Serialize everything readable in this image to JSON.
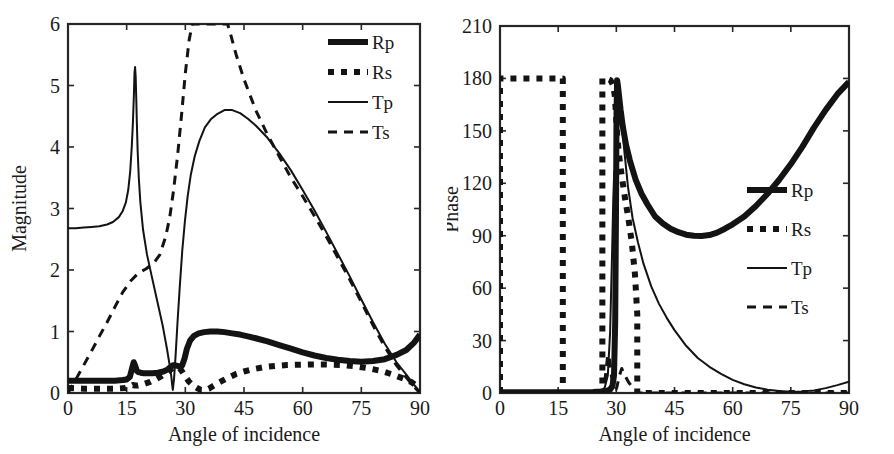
{
  "figure": {
    "background": "#ffffff",
    "ink_color": "#131313",
    "panel_count": 2
  },
  "chart_data": [
    {
      "id": "magnitude-plot",
      "type": "line",
      "title": "",
      "xlabel": "Angle of incidence",
      "ylabel": "Magnitude",
      "xlim": [
        0,
        90
      ],
      "ylim": [
        0,
        6
      ],
      "xticks": [
        0,
        15,
        30,
        45,
        60,
        75,
        90
      ],
      "yticks": [
        0,
        1,
        2,
        3,
        4,
        5,
        6
      ],
      "xticklabels": [
        "0",
        "15",
        "30",
        "45",
        "60",
        "75",
        "90"
      ],
      "yticklabels": [
        "0",
        "1",
        "2",
        "3",
        "4",
        "5",
        "6"
      ],
      "grid": false,
      "legend_position": "top-right",
      "series": [
        {
          "name": "Rp",
          "style": "thick-solid",
          "x": [
            0,
            3,
            6,
            9,
            12,
            14,
            15,
            15.8,
            16.3,
            16.8,
            17.2,
            17.6,
            18,
            18.6,
            19.4,
            20.4,
            21.6,
            23,
            24.4,
            25.4,
            26.2,
            26.8,
            27.4,
            28,
            28.6,
            29.2,
            29.8,
            30.4,
            31.2,
            32.2,
            33.4,
            34.8,
            36.4,
            38.2,
            40,
            42,
            44,
            46,
            48,
            51,
            54,
            57,
            60,
            63,
            66,
            69,
            72,
            75,
            78,
            81,
            84,
            86.5,
            88.5,
            90
          ],
          "y": [
            0.2,
            0.2,
            0.2,
            0.2,
            0.2,
            0.21,
            0.22,
            0.26,
            0.38,
            0.5,
            0.44,
            0.36,
            0.34,
            0.33,
            0.32,
            0.32,
            0.32,
            0.33,
            0.35,
            0.38,
            0.42,
            0.45,
            0.45,
            0.44,
            0.42,
            0.45,
            0.56,
            0.72,
            0.85,
            0.93,
            0.97,
            0.99,
            1.0,
            1.0,
            0.99,
            0.97,
            0.95,
            0.92,
            0.89,
            0.84,
            0.78,
            0.72,
            0.66,
            0.61,
            0.57,
            0.54,
            0.52,
            0.51,
            0.52,
            0.55,
            0.62,
            0.7,
            0.82,
            0.95
          ]
        },
        {
          "name": "Rs",
          "style": "thick-dotted",
          "x": [
            0,
            4,
            8,
            12,
            14.5,
            16,
            16.6,
            17.2,
            17.8,
            18.6,
            19.6,
            21,
            22.6,
            24,
            25.2,
            26.2,
            27,
            27.8,
            28.6,
            29.4,
            30.2,
            31,
            32,
            33,
            34,
            35,
            36,
            37,
            38,
            39.5,
            41,
            43,
            45,
            47.5,
            50,
            53,
            56,
            59,
            62,
            65,
            68,
            71,
            74,
            77,
            80,
            83,
            86,
            88,
            89,
            90
          ],
          "y": [
            0.08,
            0.07,
            0.07,
            0.07,
            0.08,
            0.11,
            0.13,
            0.12,
            0.12,
            0.13,
            0.15,
            0.18,
            0.23,
            0.28,
            0.33,
            0.38,
            0.41,
            0.42,
            0.4,
            0.33,
            0.25,
            0.18,
            0.12,
            0.08,
            0.05,
            0.05,
            0.07,
            0.11,
            0.15,
            0.2,
            0.25,
            0.31,
            0.35,
            0.39,
            0.42,
            0.44,
            0.455,
            0.46,
            0.465,
            0.465,
            0.46,
            0.45,
            0.43,
            0.4,
            0.36,
            0.3,
            0.23,
            0.17,
            0.12,
            0.05
          ]
        },
        {
          "name": "Tp",
          "style": "thin-solid",
          "x": [
            0,
            2,
            4,
            6,
            8,
            10,
            11.5,
            13,
            14,
            14.8,
            15.4,
            15.9,
            16.3,
            16.6,
            16.85,
            17.0,
            17.15,
            17.3,
            17.45,
            17.6,
            17.8,
            18.1,
            18.5,
            19.2,
            20.2,
            21.4,
            22.8,
            24.2,
            25.3,
            26.0,
            26.4,
            26.6,
            26.8,
            27.1,
            27.5,
            28.0,
            28.6,
            29.2,
            29.9,
            30.6,
            31.4,
            32.4,
            33.6,
            35,
            36.5,
            38,
            40,
            42,
            44,
            46,
            48,
            51,
            54,
            57,
            60,
            63,
            66,
            69,
            72,
            75,
            78,
            81,
            84,
            86.5,
            88.5,
            90
          ],
          "y": [
            2.68,
            2.68,
            2.69,
            2.7,
            2.71,
            2.74,
            2.78,
            2.86,
            2.96,
            3.1,
            3.3,
            3.6,
            4.0,
            4.4,
            4.85,
            5.2,
            5.3,
            5.15,
            4.8,
            4.4,
            3.95,
            3.5,
            3.1,
            2.65,
            2.25,
            1.9,
            1.5,
            1.1,
            0.72,
            0.45,
            0.28,
            0.15,
            0.05,
            0.22,
            0.6,
            1.15,
            1.75,
            2.3,
            2.8,
            3.2,
            3.55,
            3.85,
            4.1,
            4.32,
            4.45,
            4.53,
            4.6,
            4.6,
            4.55,
            4.46,
            4.35,
            4.15,
            3.9,
            3.62,
            3.3,
            2.97,
            2.62,
            2.26,
            1.9,
            1.52,
            1.15,
            0.8,
            0.5,
            0.3,
            0.13,
            0.02
          ]
        },
        {
          "name": "Ts",
          "style": "thin-dashed",
          "x": [
            0,
            2,
            4,
            6,
            8,
            10,
            12,
            14,
            16,
            18,
            20,
            22,
            23.5,
            25,
            26,
            27,
            28,
            29,
            30,
            31,
            31.8,
            32.5,
            33.2,
            34,
            36,
            38,
            40,
            40.8,
            41.5,
            43,
            45,
            48,
            51,
            54,
            57,
            60,
            63,
            66,
            69,
            72,
            75,
            78,
            81,
            84,
            86.5,
            88.5,
            90
          ],
          "y": [
            0.0,
            0.22,
            0.45,
            0.68,
            0.92,
            1.15,
            1.4,
            1.64,
            1.82,
            1.95,
            2.02,
            2.12,
            2.25,
            2.55,
            2.85,
            3.3,
            3.85,
            4.5,
            5.2,
            5.75,
            6.0,
            6.0,
            6.0,
            6.0,
            6.0,
            6.0,
            6.0,
            6.0,
            5.85,
            5.5,
            5.1,
            4.6,
            4.2,
            3.85,
            3.5,
            3.2,
            2.88,
            2.55,
            2.2,
            1.85,
            1.48,
            1.1,
            0.75,
            0.45,
            0.25,
            0.1,
            0.0
          ]
        }
      ]
    },
    {
      "id": "phase-plot",
      "type": "line",
      "title": "",
      "xlabel": "Angle of incidence",
      "ylabel": "Phase",
      "xlim": [
        0,
        90
      ],
      "ylim": [
        0,
        210
      ],
      "xticks": [
        0,
        15,
        30,
        45,
        60,
        75,
        90
      ],
      "yticks": [
        0,
        30,
        60,
        90,
        120,
        150,
        180,
        210
      ],
      "xticklabels": [
        "0",
        "15",
        "30",
        "45",
        "60",
        "75",
        "90"
      ],
      "yticklabels": [
        "0",
        "30",
        "60",
        "90",
        "120",
        "150",
        "180",
        "210"
      ],
      "grid": false,
      "legend_position": "middle-right",
      "series": [
        {
          "name": "Rp",
          "style": "thick-solid",
          "x": [
            0,
            5,
            10,
            15,
            20,
            24,
            26,
            27.5,
            28.4,
            29.0,
            29.4,
            29.7,
            29.9,
            30.05,
            30.2,
            30.4,
            30.7,
            31.1,
            31.7,
            32.5,
            33.5,
            35,
            36.5,
            38,
            40,
            42,
            44,
            46,
            48,
            50,
            52,
            54,
            56,
            58,
            60,
            63,
            66,
            69,
            72,
            75,
            78,
            81,
            84,
            87,
            90
          ],
          "y": [
            0.5,
            0.5,
            0.5,
            0.5,
            0.5,
            0.6,
            0.8,
            1.2,
            2.0,
            4.0,
            10,
            40,
            100,
            160,
            179,
            176,
            170,
            162,
            152,
            142,
            133,
            122,
            114,
            108,
            101,
            97,
            94,
            92,
            90.6,
            90.0,
            89.8,
            90.4,
            91.8,
            94,
            96.5,
            101,
            107,
            114,
            122,
            131,
            141,
            152,
            162,
            171,
            178
          ]
        },
        {
          "name": "Rs",
          "style": "thick-dotted",
          "x": [
            0,
            0,
            8,
            16.2,
            16.2,
            22,
            26.4,
            26.4,
            27.5,
            28.5,
            29.2,
            29.6,
            29.9,
            30.2,
            30.7,
            31.4,
            32.2,
            33.1,
            34,
            34.8,
            35.4,
            35.4,
            40,
            50,
            60,
            70,
            80,
            90
          ],
          "y": [
            0,
            180,
            180,
            180,
            0,
            0,
            0,
            180,
            180,
            179,
            176,
            170,
            160,
            148,
            136,
            124,
            112,
            100,
            86,
            68,
            45,
            0,
            0,
            0,
            0,
            0,
            0,
            0
          ]
        },
        {
          "name": "Tp",
          "style": "thin-solid",
          "x": [
            0,
            5,
            10,
            15,
            20,
            24,
            26,
            27.0,
            27.8,
            28.4,
            28.9,
            29.2,
            29.45,
            29.65,
            29.8,
            29.95,
            30.05,
            30.2,
            30.45,
            30.8,
            31.3,
            32,
            33,
            34.2,
            35.6,
            37,
            39,
            41,
            43,
            45,
            48,
            51,
            54,
            57,
            60,
            63,
            66,
            69,
            72,
            75,
            78,
            81,
            84,
            87,
            90
          ],
          "y": [
            0.4,
            0.4,
            0.4,
            0.4,
            0.4,
            0.5,
            1.0,
            3,
            10,
            35,
            80,
            110,
            126,
            128,
            129,
            135,
            150,
            172,
            176,
            170,
            158,
            140,
            118,
            100,
            86,
            74,
            61,
            51,
            43,
            36,
            27,
            20,
            15,
            11,
            7.5,
            5.0,
            3.2,
            1.9,
            1.1,
            0.7,
            0.8,
            1.5,
            2.8,
            4.5,
            6.5
          ]
        },
        {
          "name": "Ts",
          "style": "thin-dashed",
          "x": [
            0,
            5,
            10,
            15,
            20,
            24,
            26,
            26.6,
            27.0,
            27.4,
            27.8,
            28.2,
            28.6,
            29.0,
            29.4,
            29.7,
            29.9,
            30.1,
            30.4,
            30.8,
            31.4,
            32.2,
            33.2,
            34.3,
            35.3,
            35.4,
            40,
            50,
            60,
            70,
            80,
            90
          ],
          "y": [
            0,
            0,
            0,
            0,
            0,
            0,
            0.5,
            2,
            6,
            14,
            22,
            20,
            12,
            6,
            3,
            2,
            2,
            3,
            6,
            10,
            14,
            10,
            6,
            3,
            1,
            0,
            0,
            0,
            0,
            0,
            0,
            0
          ]
        }
      ]
    }
  ],
  "panels": {
    "left": {
      "name": "magnitude-panel",
      "ylabel": "Magnitude",
      "xlabel": "Angle of incidence",
      "legend": [
        {
          "label": "Rp",
          "style": "thick-solid"
        },
        {
          "label": "Rs",
          "style": "thick-dotted"
        },
        {
          "label": "Tp",
          "style": "thin-solid"
        },
        {
          "label": "Ts",
          "style": "thin-dashed"
        }
      ]
    },
    "right": {
      "name": "phase-panel",
      "ylabel": "Phase",
      "xlabel": "Angle of incidence",
      "legend": [
        {
          "label": "Rp",
          "style": "thick-solid"
        },
        {
          "label": "Rs",
          "style": "thick-dotted"
        },
        {
          "label": "Tp",
          "style": "thin-solid"
        },
        {
          "label": "Ts",
          "style": "thin-dashed"
        }
      ]
    }
  }
}
